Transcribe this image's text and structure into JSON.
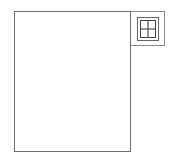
{
  "diagram": {
    "main_panel": {
      "label": ""
    },
    "corner_box": {
      "icon": "window-icon",
      "stroke_color": "#666666"
    },
    "colors": {
      "background": "#ffffff",
      "border": "#6e6e6e"
    }
  }
}
